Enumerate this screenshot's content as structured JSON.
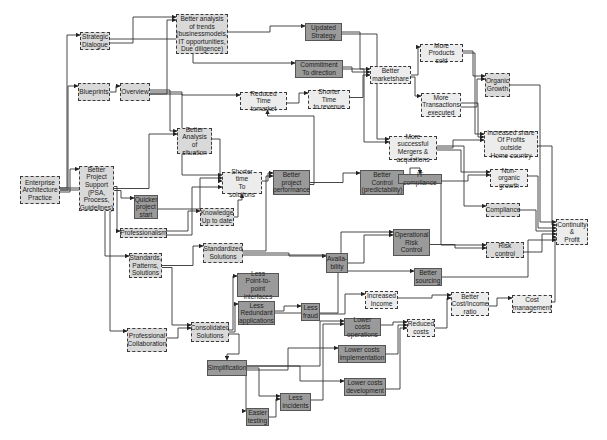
{
  "diagram": {
    "type": "flow-diagram",
    "nodes": [
      {
        "id": "eap",
        "label": "Enterprise\nArchitecture\nPractice",
        "style": "dashed",
        "x": 20,
        "y": 176,
        "w": 40,
        "h": 28
      },
      {
        "id": "strategic",
        "label": "Strategic\nDialogue",
        "style": "dashed",
        "x": 80,
        "y": 32,
        "w": 30,
        "h": 18
      },
      {
        "id": "trends",
        "label": "Better analysis\nof trends\n(businessmodels,\nIT opportunities,\nDue diligence)",
        "style": "dashed",
        "x": 176,
        "y": 14,
        "w": 52,
        "h": 40
      },
      {
        "id": "updated",
        "label": "Updated\nStrategy",
        "style": "solid",
        "x": 305,
        "y": 23,
        "w": 37,
        "h": 18
      },
      {
        "id": "commit",
        "label": "Commitment\nTo direction",
        "style": "solid",
        "x": 295,
        "y": 60,
        "w": 48,
        "h": 18
      },
      {
        "id": "blueprints",
        "label": "Blueprints",
        "style": "dashed",
        "x": 78,
        "y": 83,
        "w": 32,
        "h": 18
      },
      {
        "id": "overview",
        "label": "Overview",
        "style": "dashed",
        "x": 120,
        "y": 83,
        "w": 30,
        "h": 18
      },
      {
        "id": "reducedtm",
        "label": "Reduced\nTime tomarket",
        "style": "light",
        "x": 240,
        "y": 92,
        "w": 47,
        "h": 18
      },
      {
        "id": "shorterrev",
        "label": "Shorter Time\nto revenue",
        "style": "light",
        "x": 308,
        "y": 90,
        "w": 42,
        "h": 19
      },
      {
        "id": "marketshare",
        "label": "Better\nmarketshare",
        "style": "light",
        "x": 370,
        "y": 66,
        "w": 41,
        "h": 18
      },
      {
        "id": "products",
        "label": "More\nProducts sold",
        "style": "light",
        "x": 420,
        "y": 44,
        "w": 43,
        "h": 18
      },
      {
        "id": "transactions",
        "label": "More\nTransactions\nexecuted",
        "style": "light",
        "x": 421,
        "y": 93,
        "w": 40,
        "h": 24
      },
      {
        "id": "organic",
        "label": "Organic\nGrowth",
        "style": "dashed",
        "x": 485,
        "y": 73,
        "w": 25,
        "h": 24
      },
      {
        "id": "mergers",
        "label": "More successful\nMergers &\nacquistions",
        "style": "light",
        "x": 389,
        "y": 136,
        "w": 48,
        "h": 24
      },
      {
        "id": "shareprofits",
        "label": "Increased share\nOf Profits outside\nHome country",
        "style": "light",
        "x": 484,
        "y": 131,
        "w": 54,
        "h": 26
      },
      {
        "id": "analysis",
        "label": "Better\nAnalysis of\nsituation",
        "style": "dashed",
        "x": 177,
        "y": 128,
        "w": 35,
        "h": 26
      },
      {
        "id": "projsupport",
        "label": "Better\nProject\nSupport\n(PSA,\nProcess,\nGuidelines)",
        "style": "dashed",
        "x": 79,
        "y": 166,
        "w": 35,
        "h": 45
      },
      {
        "id": "quicker",
        "label": "Quicker\nproject\nstart",
        "style": "solid",
        "x": 134,
        "y": 195,
        "w": 24,
        "h": 24
      },
      {
        "id": "shortersol",
        "label": "Shorter time\nTo solutions",
        "style": "light",
        "x": 222,
        "y": 172,
        "w": 40,
        "h": 22
      },
      {
        "id": "projperf",
        "label": "Better\nproject\nperformance",
        "style": "solid",
        "x": 273,
        "y": 170,
        "w": 37,
        "h": 25
      },
      {
        "id": "control",
        "label": "Better\nControl\n(predictability)",
        "style": "solid",
        "x": 360,
        "y": 170,
        "w": 44,
        "h": 25
      },
      {
        "id": "itcomp",
        "label": "IT compliance",
        "style": "solid",
        "x": 398,
        "y": 174,
        "w": 44,
        "h": 10
      },
      {
        "id": "nonorganic",
        "label": "Non-organic\ngrowth",
        "style": "light",
        "x": 490,
        "y": 169,
        "w": 38,
        "h": 18
      },
      {
        "id": "compliance",
        "label": "Compliance",
        "style": "dashed",
        "x": 486,
        "y": 203,
        "w": 34,
        "h": 14
      },
      {
        "id": "continuity",
        "label": "Continuity\n&\nProfit",
        "style": "light",
        "x": 556,
        "y": 219,
        "w": 32,
        "h": 26
      },
      {
        "id": "knowledge",
        "label": "Knowledge\nUp to date",
        "style": "dashed",
        "x": 200,
        "y": 208,
        "w": 34,
        "h": 18
      },
      {
        "id": "professionalism",
        "label": "Professionalism",
        "style": "dashed",
        "x": 120,
        "y": 228,
        "w": 47,
        "h": 10
      },
      {
        "id": "standards",
        "label": "Standards,\nPatterns,\nSolutions",
        "style": "dashed",
        "x": 129,
        "y": 253,
        "w": 33,
        "h": 25
      },
      {
        "id": "standardized",
        "label": "Standardized\nSolutions",
        "style": "dashed",
        "x": 203,
        "y": 243,
        "w": 40,
        "h": 20
      },
      {
        "id": "availability",
        "label": "Availa-\nbility",
        "style": "solid",
        "x": 326,
        "y": 253,
        "w": 22,
        "h": 20
      },
      {
        "id": "oprisk",
        "label": "Operational\nRisk\nControl",
        "style": "solid",
        "x": 393,
        "y": 229,
        "w": 37,
        "h": 27
      },
      {
        "id": "riskcontrol",
        "label": "Risk\ncontrol",
        "style": "dashed",
        "x": 486,
        "y": 242,
        "w": 38,
        "h": 16
      },
      {
        "id": "p2p",
        "label": "Less\nPoint-to-point\ninterfaces",
        "style": "solid",
        "x": 237,
        "y": 273,
        "w": 42,
        "h": 24
      },
      {
        "id": "redundant",
        "label": "Less\nRedundant\napplications",
        "style": "solid",
        "x": 238,
        "y": 301,
        "w": 37,
        "h": 24
      },
      {
        "id": "sourcing",
        "label": "Better\nsourcing",
        "style": "solid",
        "x": 414,
        "y": 268,
        "w": 28,
        "h": 18
      },
      {
        "id": "increasedinc",
        "label": "Increased\nIncome",
        "style": "light",
        "x": 365,
        "y": 291,
        "w": 33,
        "h": 18
      },
      {
        "id": "costincome",
        "label": "Better\nCost/Income\nratio",
        "style": "light",
        "x": 451,
        "y": 292,
        "w": 38,
        "h": 24
      },
      {
        "id": "costmgmt",
        "label": "Cost\nmanagement",
        "style": "light",
        "x": 512,
        "y": 295,
        "w": 40,
        "h": 18
      },
      {
        "id": "lessfraud",
        "label": "Less\nfraud",
        "style": "solid",
        "x": 301,
        "y": 303,
        "w": 19,
        "h": 18
      },
      {
        "id": "lowerops",
        "label": "Lower costs\noperations",
        "style": "solid",
        "x": 344,
        "y": 318,
        "w": 37,
        "h": 18
      },
      {
        "id": "reducedcosts",
        "label": "Reduced\ncosts",
        "style": "light",
        "x": 407,
        "y": 319,
        "w": 28,
        "h": 18
      },
      {
        "id": "collab",
        "label": "Professional\nCollaboration",
        "style": "dashed",
        "x": 127,
        "y": 328,
        "w": 40,
        "h": 24
      },
      {
        "id": "consolidated",
        "label": "Consolidated\nSolutions",
        "style": "dashed",
        "x": 191,
        "y": 322,
        "w": 38,
        "h": 20
      },
      {
        "id": "lowerimpl",
        "label": "Lower costs\nimplementation",
        "style": "solid",
        "x": 338,
        "y": 345,
        "w": 48,
        "h": 18
      },
      {
        "id": "simplification",
        "label": "Simplification",
        "style": "solid",
        "x": 207,
        "y": 360,
        "w": 40,
        "h": 16
      },
      {
        "id": "lowerdev",
        "label": "Lower costs\ndevelopment",
        "style": "solid",
        "x": 344,
        "y": 378,
        "w": 42,
        "h": 18
      },
      {
        "id": "lessincidents",
        "label": "Less\nincidents",
        "style": "solid",
        "x": 280,
        "y": 393,
        "w": 31,
        "h": 18
      },
      {
        "id": "easiertesting",
        "label": "Easier\ntesting",
        "style": "solid",
        "x": 246,
        "y": 408,
        "w": 23,
        "h": 18
      }
    ],
    "edges": [
      [
        "eap",
        "strategic"
      ],
      [
        "eap",
        "blueprints"
      ],
      [
        "eap",
        "projsupport"
      ],
      [
        "eap",
        "standards"
      ],
      [
        "eap",
        "collab"
      ],
      [
        "strategic",
        "trends"
      ],
      [
        "strategic",
        "commit"
      ],
      [
        "blueprints",
        "overview"
      ],
      [
        "overview",
        "trends"
      ],
      [
        "overview",
        "analysis"
      ],
      [
        "overview",
        "reducedtm"
      ],
      [
        "overview",
        "shortersol"
      ],
      [
        "trends",
        "updated"
      ],
      [
        "updated",
        "marketshare"
      ],
      [
        "updated",
        "mergers"
      ],
      [
        "commit",
        "marketshare"
      ],
      [
        "commit",
        "mergers"
      ],
      [
        "reducedtm",
        "shorterrev"
      ],
      [
        "shorterrev",
        "marketshare"
      ],
      [
        "marketshare",
        "products"
      ],
      [
        "marketshare",
        "transactions"
      ],
      [
        "products",
        "organic"
      ],
      [
        "products",
        "shareprofits"
      ],
      [
        "transactions",
        "organic"
      ],
      [
        "transactions",
        "shareprofits"
      ],
      [
        "mergers",
        "shareprofits"
      ],
      [
        "mergers",
        "nonorganic"
      ],
      [
        "mergers",
        "compliance"
      ],
      [
        "organic",
        "continuity"
      ],
      [
        "shareprofits",
        "continuity"
      ],
      [
        "nonorganic",
        "continuity"
      ],
      [
        "compliance",
        "continuity"
      ],
      [
        "riskcontrol",
        "continuity"
      ],
      [
        "costmgmt",
        "continuity"
      ],
      [
        "sourcing",
        "continuity"
      ],
      [
        "projsupport",
        "quicker"
      ],
      [
        "projsupport",
        "professionalism"
      ],
      [
        "projsupport",
        "analysis"
      ],
      [
        "quicker",
        "shortersol"
      ],
      [
        "analysis",
        "shortersol"
      ],
      [
        "knowledge",
        "shortersol"
      ],
      [
        "professionalism",
        "shortersol"
      ],
      [
        "shortersol",
        "projperf"
      ],
      [
        "projperf",
        "control"
      ],
      [
        "projperf",
        "reducedtm"
      ],
      [
        "control",
        "itcomp"
      ],
      [
        "control",
        "riskcontrol"
      ],
      [
        "itcomp",
        "nonorganic"
      ],
      [
        "professionalism",
        "knowledge"
      ],
      [
        "standards",
        "standardized"
      ],
      [
        "standards",
        "consolidated"
      ],
      [
        "collab",
        "consolidated"
      ],
      [
        "standardized",
        "availability"
      ],
      [
        "standardized",
        "oprisk"
      ],
      [
        "standardized",
        "projperf"
      ],
      [
        "availability",
        "oprisk"
      ],
      [
        "oprisk",
        "riskcontrol"
      ],
      [
        "consolidated",
        "p2p"
      ],
      [
        "consolidated",
        "redundant"
      ],
      [
        "consolidated",
        "simplification"
      ],
      [
        "redundant",
        "lessfraud"
      ],
      [
        "redundant",
        "sourcing"
      ],
      [
        "lessfraud",
        "increasedinc"
      ],
      [
        "increasedinc",
        "costincome"
      ],
      [
        "reducedcosts",
        "costincome"
      ],
      [
        "costincome",
        "costmgmt"
      ],
      [
        "lowerops",
        "reducedcosts"
      ],
      [
        "lowerimpl",
        "reducedcosts"
      ],
      [
        "lowerdev",
        "reducedcosts"
      ],
      [
        "simplification",
        "lowerops"
      ],
      [
        "simplification",
        "lessincidents"
      ],
      [
        "simplification",
        "lowerimpl"
      ],
      [
        "simplification",
        "lowerdev"
      ],
      [
        "easiertesting",
        "lessincidents"
      ],
      [
        "simplification",
        "easiertesting"
      ],
      [
        "lessincidents",
        "lowerops"
      ]
    ]
  }
}
